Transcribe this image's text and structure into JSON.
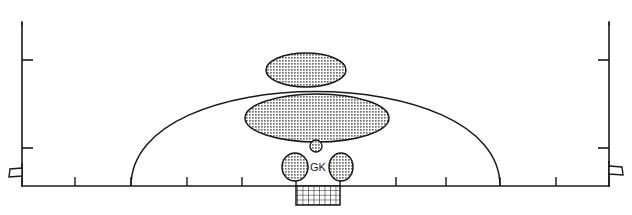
{
  "diagram": {
    "type": "soccer-pitch-schematic",
    "canvas": {
      "width": 632,
      "height": 215
    },
    "colors": {
      "line": "#1a1a1a",
      "background": "#ffffff",
      "zone_fill": "#8c8c8c",
      "zone_stroke": "#1a1a1a",
      "net_line": "#1a1a1a"
    },
    "labels": {
      "goalkeeper": "GK"
    },
    "pitch_outline": {
      "name": "penalty-area-box",
      "left_x": 22,
      "right_x": 609,
      "top_y": 22,
      "bottom_y": 186
    },
    "arc": {
      "name": "penalty-arc",
      "left_end_x": 131,
      "right_end_x": 500,
      "baseline_y": 186,
      "apex_y": 63
    },
    "goal_net": {
      "name": "goal-net",
      "x": 296,
      "y": 186,
      "width": 44,
      "height": 19,
      "columns": 8,
      "rows": 4
    },
    "corner_flags": [
      {
        "name": "corner-flag-left",
        "x": 22,
        "y": 170,
        "direction": "left"
      },
      {
        "name": "corner-flag-right",
        "x": 609,
        "y": 168,
        "direction": "right"
      }
    ],
    "side_ticks_left": [
      {
        "y": 60,
        "length": 11
      },
      {
        "y": 148,
        "length": 11
      }
    ],
    "side_ticks_right": [
      {
        "y": 60,
        "length": 11
      },
      {
        "y": 148,
        "length": 11
      }
    ],
    "baseline_ticks": [
      {
        "x": 75,
        "length": 9
      },
      {
        "x": 131,
        "length": 9
      },
      {
        "x": 187,
        "length": 9
      },
      {
        "x": 242,
        "length": 9
      },
      {
        "x": 296,
        "length": 9
      },
      {
        "x": 340,
        "length": 9
      },
      {
        "x": 396,
        "length": 9
      },
      {
        "x": 446,
        "length": 9
      },
      {
        "x": 500,
        "length": 9
      },
      {
        "x": 556,
        "length": 9
      }
    ],
    "zones": [
      {
        "name": "zone-upper-ellipse",
        "shape": "ellipse",
        "cx": 306,
        "cy": 70,
        "rx": 40,
        "ry": 17
      },
      {
        "name": "zone-main-ellipse",
        "shape": "ellipse",
        "cx": 317,
        "cy": 118,
        "rx": 72,
        "ry": 24
      },
      {
        "name": "zone-ball-marker",
        "shape": "ellipse",
        "cx": 316,
        "cy": 146,
        "rx": 6,
        "ry": 6
      },
      {
        "name": "zone-gk-left-post",
        "shape": "ellipse",
        "cx": 295,
        "cy": 167,
        "rx": 13,
        "ry": 14
      },
      {
        "name": "zone-gk-right-post",
        "shape": "ellipse",
        "cx": 341,
        "cy": 167,
        "rx": 12,
        "ry": 14
      }
    ],
    "gk_label_position": {
      "x": 318,
      "y": 167
    }
  }
}
